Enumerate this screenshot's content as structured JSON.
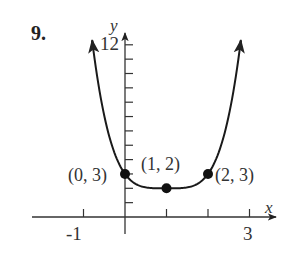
{
  "problem_number": "9.",
  "chart_data": {
    "type": "line",
    "title": "",
    "function_hint": "y = (x - 1)^4 + 2",
    "xlabel": "x",
    "ylabel": "y",
    "xlim": [
      -1.2,
      3.3
    ],
    "ylim": [
      0,
      12.5
    ],
    "x_tick_values": [
      -1,
      0,
      1,
      2,
      3
    ],
    "x_tick_labels": [
      "-1",
      "",
      "",
      "",
      "3"
    ],
    "y_tick_values": [
      1,
      2,
      3,
      4,
      5,
      6,
      7,
      8,
      9,
      10,
      11,
      12
    ],
    "y_tick_labels": [
      "",
      "",
      "",
      "",
      "",
      "",
      "",
      "",
      "",
      "",
      "",
      "12"
    ],
    "grid": false,
    "legend": null,
    "series": [
      {
        "name": "curve",
        "x": [
          -0.9,
          -0.75,
          -0.5,
          -0.25,
          0,
          0.25,
          0.5,
          0.75,
          1,
          1.25,
          1.5,
          1.75,
          2,
          2.25,
          2.5,
          2.75,
          2.9
        ],
        "y": [
          15.03,
          11.38,
          7.06,
          4.44,
          3,
          2.32,
          2.06,
          2.0,
          2,
          2.0,
          2.06,
          2.32,
          3,
          4.44,
          7.06,
          11.38,
          15.03
        ]
      }
    ],
    "points": [
      {
        "x": 0,
        "y": 3,
        "label": "(0, 3)"
      },
      {
        "x": 1,
        "y": 2,
        "label": "(1, 2)"
      },
      {
        "x": 2,
        "y": 3,
        "label": "(2, 3)"
      }
    ],
    "colors": {
      "curve": "#1a1a1a",
      "axes": "#333333",
      "text": "#333333"
    }
  }
}
